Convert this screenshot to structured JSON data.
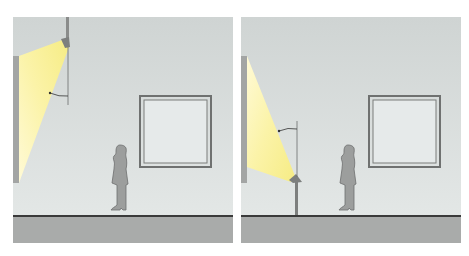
{
  "figure": {
    "type": "lighting-diagram",
    "panels": [
      {
        "id": "left",
        "description": "Ceiling-mounted luminaire on pendant rod, beam angled toward left wall",
        "fixture_position": "ceiling",
        "beam_target": "left wall, upper area",
        "has_angle_annotation": true
      },
      {
        "id": "right",
        "description": "Floor-standing luminaire on post, beam angled upward toward left wall",
        "fixture_position": "floor post",
        "beam_target": "left wall, upper area",
        "has_angle_annotation": true
      }
    ],
    "elements": [
      "wall",
      "floor",
      "framed-picture",
      "standing-person",
      "light-beam",
      "luminaire"
    ]
  },
  "colors": {
    "wall": "#dde2e1",
    "wall_top": "#cfd4d3",
    "floor": "#a9abaa",
    "floor_line": "#3a3a3a",
    "beam": "#fbf4a6",
    "beam_bright": "#fffbd0",
    "side_wall": "#a3a5a4",
    "frame": "#6f7170",
    "person": "#9c9e9d"
  }
}
